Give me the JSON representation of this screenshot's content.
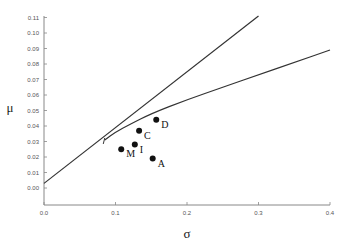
{
  "chart_data": {
    "type": "line",
    "title": "",
    "xlabel": "σ",
    "ylabel": "μ",
    "xlim": [
      0.0,
      0.4
    ],
    "ylim": [
      -0.011,
      0.11
    ],
    "x_ticks": [
      "0.0",
      "0.1",
      "0.2",
      "0.3",
      "0.4"
    ],
    "y_ticks": [
      "0.00",
      "0.01",
      "0.02",
      "0.03",
      "0.04",
      "0.05",
      "0.06",
      "0.07",
      "0.08",
      "0.09",
      "0.10",
      "0.11"
    ],
    "grid": false,
    "legend": null,
    "series": [
      {
        "name": "Capital market line",
        "kind": "line",
        "x": [
          0.0,
          0.3
        ],
        "y": [
          0.003,
          0.111
        ]
      },
      {
        "name": "Efficient frontier",
        "kind": "curve",
        "x": [
          0.085,
          0.1,
          0.12,
          0.15,
          0.2,
          0.25,
          0.3,
          0.35,
          0.4
        ],
        "y": [
          0.031,
          0.036,
          0.041,
          0.048,
          0.057,
          0.065,
          0.073,
          0.081,
          0.089
        ]
      }
    ],
    "points": [
      {
        "label": "D",
        "sigma": 0.157,
        "mu": 0.044
      },
      {
        "label": "C",
        "sigma": 0.133,
        "mu": 0.037
      },
      {
        "label": "I",
        "sigma": 0.127,
        "mu": 0.028
      },
      {
        "label": "M",
        "sigma": 0.108,
        "mu": 0.025
      },
      {
        "label": "A",
        "sigma": 0.152,
        "mu": 0.019
      }
    ]
  }
}
